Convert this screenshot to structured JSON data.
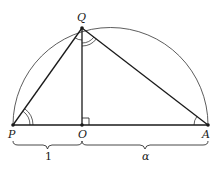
{
  "diagram": {
    "points": {
      "P": {
        "label": "P",
        "x": 13,
        "y": 125
      },
      "O": {
        "label": "O",
        "x": 82,
        "y": 125
      },
      "A": {
        "label": "A",
        "x": 208,
        "y": 125
      },
      "Q": {
        "label": "Q",
        "x": 82,
        "y": 28
      }
    },
    "segments": [
      {
        "from": "P",
        "to": "A"
      },
      {
        "from": "P",
        "to": "Q"
      },
      {
        "from": "Q",
        "to": "A"
      },
      {
        "from": "Q",
        "to": "O"
      }
    ],
    "arc": {
      "type": "semicircle",
      "diameter": [
        "P",
        "A"
      ]
    },
    "right_angle_at": "O",
    "angle_marks": [
      {
        "vertex": "P",
        "type": "double-arc"
      },
      {
        "vertex": "Q",
        "between": [
          "O",
          "A"
        ],
        "type": "double-arc"
      },
      {
        "vertex": "Q",
        "between": [
          "P",
          "O"
        ],
        "type": "single-arc"
      },
      {
        "vertex": "A",
        "type": "single-arc"
      }
    ],
    "braces": [
      {
        "from": "P",
        "to": "O",
        "label": "1"
      },
      {
        "from": "O",
        "to": "A",
        "label": "α"
      }
    ],
    "colors": {
      "stroke": "#1a1a1a",
      "background": "#ffffff"
    }
  }
}
